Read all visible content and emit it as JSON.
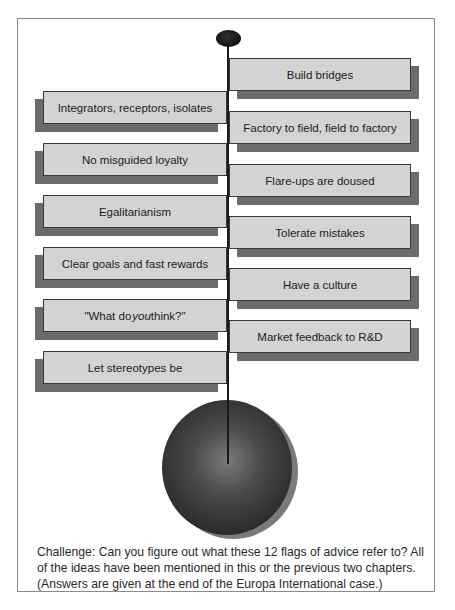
{
  "diagram": {
    "title": "",
    "structure": "flagpole with 12 alternating flags and a sphere base",
    "colors": {
      "flag_fill": "#d3d3d3",
      "flag_border": "#3a3a3a",
      "flag_shadow": "#6b6b6b",
      "pole": "#1a1a1a",
      "sphere": "#2b2b2b",
      "frame_border": "#8a8a8a"
    },
    "flags": [
      {
        "side": "right",
        "label": "Build bridges"
      },
      {
        "side": "left",
        "label": "Integrators, receptors, isolates"
      },
      {
        "side": "right",
        "label": "Factory to field, field to factory"
      },
      {
        "side": "left",
        "label": "No misguided loyalty"
      },
      {
        "side": "right",
        "label": "Flare-ups are doused"
      },
      {
        "side": "left",
        "label": "Egalitarianism"
      },
      {
        "side": "right",
        "label": "Tolerate mistakes"
      },
      {
        "side": "left",
        "label": "Clear goals and fast rewards"
      },
      {
        "side": "right",
        "label": "Have a culture"
      },
      {
        "side": "left",
        "label_pre": "\"What do ",
        "label_em": "you",
        "label_post": " think?\""
      },
      {
        "side": "right",
        "label": "Market feedback to R&D"
      },
      {
        "side": "left",
        "label": "Let stereotypes be"
      }
    ],
    "caption": "Challenge:  Can you figure out what these 12 flags of advice refer to? All of the ideas have been mentioned in this or the previous two chapters. (Answers are given at the end of the Europa International case.)"
  }
}
